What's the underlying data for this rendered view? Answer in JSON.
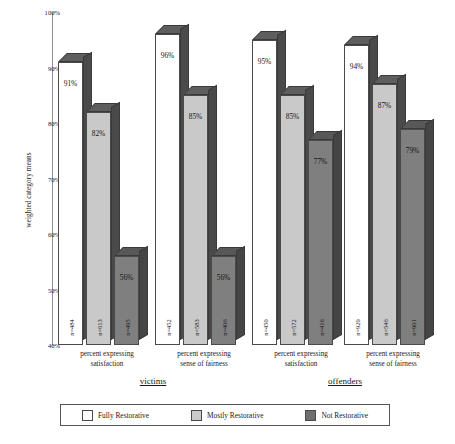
{
  "chart_data": {
    "type": "bar",
    "title": "",
    "xlabel": "",
    "ylabel": "weighted category means",
    "ylim": [
      40,
      100
    ],
    "ytick_labels": [
      "100%",
      "90%",
      "80%",
      "70%",
      "60%",
      "50%",
      "40%"
    ],
    "ytick_values": [
      100,
      90,
      80,
      70,
      60,
      50,
      40
    ],
    "grid": false,
    "legend_position": "bottom",
    "categories": [
      "percent expressing satisfaction",
      "percent expressing sense of fairness",
      "percent expressing satisfaction",
      "percent expressing sense of fairness"
    ],
    "super_groups": [
      "victims",
      "offenders"
    ],
    "series": [
      {
        "name": "Fully Restorative",
        "color": "#ffffff",
        "values": [
          91,
          96,
          95,
          94
        ],
        "value_labels": [
          "91%",
          "96%",
          "95%",
          "94%"
        ],
        "n_labels": [
          "n=484",
          "n=452",
          "n=450",
          "n=920"
        ]
      },
      {
        "name": "Mostly Restorative",
        "color": "#c9c9c9",
        "values": [
          82,
          85,
          85,
          87
        ],
        "value_labels": [
          "82%",
          "85%",
          "85%",
          "87%"
        ],
        "n_labels": [
          "n=613",
          "n=583",
          "n=572",
          "n=546"
        ]
      },
      {
        "name": "Not Restorative",
        "color": "#7f7f7f",
        "values": [
          56,
          56,
          77,
          79
        ],
        "value_labels": [
          "56%",
          "56%",
          "77%",
          "79%"
        ],
        "n_labels": [
          "n=495",
          "n=406",
          "n=416",
          "n=901"
        ]
      }
    ]
  },
  "axis": {
    "y_title": "weighted category means",
    "ticks": [
      "100%",
      "90%",
      "80%",
      "70%",
      "60%",
      "50%",
      "40%"
    ]
  },
  "groups": [
    {
      "label": "victims"
    },
    {
      "label": "offenders"
    }
  ],
  "categories": [
    {
      "line1": "percent expressing",
      "line2": "satisfaction"
    },
    {
      "line1": "percent expressing",
      "line2": "sense of fairness"
    },
    {
      "line1": "percent expressing",
      "line2": "satisfaction"
    },
    {
      "line1": "percent expressing",
      "line2": "sense of fairness"
    }
  ],
  "legend": {
    "items": [
      {
        "label": "Fully Restorative",
        "key": "fully"
      },
      {
        "label": "Mostly Restorative",
        "key": "mostly"
      },
      {
        "label": "Not Restorative",
        "key": "not"
      }
    ]
  },
  "bars": [
    {
      "value_label": "91%",
      "n_label": "n=484",
      "style": "fully"
    },
    {
      "value_label": "82%",
      "n_label": "n=613",
      "style": "mostly"
    },
    {
      "value_label": "56%",
      "n_label": "n=495",
      "style": "not"
    },
    {
      "value_label": "96%",
      "n_label": "n=452",
      "style": "fully"
    },
    {
      "value_label": "85%",
      "n_label": "n=583",
      "style": "mostly"
    },
    {
      "value_label": "56%",
      "n_label": "n=406",
      "style": "not"
    },
    {
      "value_label": "95%",
      "n_label": "n=450",
      "style": "fully"
    },
    {
      "value_label": "85%",
      "n_label": "n=572",
      "style": "mostly"
    },
    {
      "value_label": "77%",
      "n_label": "n=416",
      "style": "not"
    },
    {
      "value_label": "94%",
      "n_label": "n=920",
      "style": "fully"
    },
    {
      "value_label": "87%",
      "n_label": "n=546",
      "style": "mostly"
    },
    {
      "value_label": "79%",
      "n_label": "n=901",
      "style": "not"
    }
  ]
}
